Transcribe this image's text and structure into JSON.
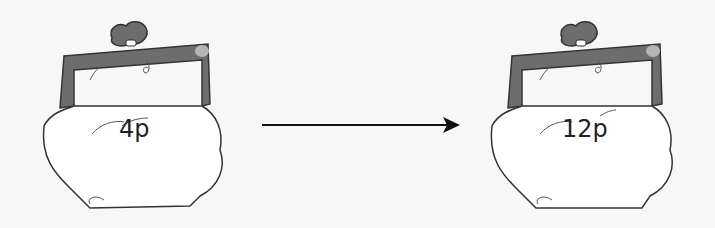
{
  "diagram": {
    "left_purse": {
      "amount": "4p"
    },
    "right_purse": {
      "amount": "12p"
    },
    "arrow": {
      "direction": "right"
    },
    "colors": {
      "frame": "#6d6d6d",
      "frame_highlight": "#b5b5b5",
      "body": "#ffffff",
      "outline": "#333333",
      "background": "#f7f7f7"
    }
  }
}
